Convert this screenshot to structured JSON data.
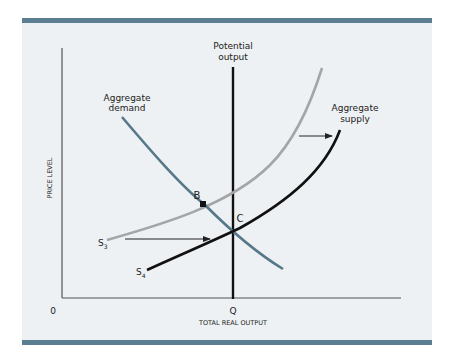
{
  "diagram": {
    "title": "",
    "y_axis_label": "PRICE LEVEL",
    "x_axis_label": "TOTAL REAL OUTPUT",
    "origin_label": "0",
    "q_label": "Q",
    "potential_output_label_line1": "Potential",
    "potential_output_label_line2": "output",
    "aggregate_demand_label_line1": "Aggregate",
    "aggregate_demand_label_line2": "demand",
    "aggregate_supply_label_line1": "Aggregate",
    "aggregate_supply_label_line2": "supply",
    "s3_label": "S",
    "s3_subscript": "3",
    "s4_label": "S",
    "s4_subscript": "4",
    "point_b_label": "B",
    "point_c_label": "C"
  },
  "colors": {
    "frame_bar": "#5b7f91",
    "panel_bg": "#eef1f3",
    "aggregate_demand": "#56788a",
    "supply_s3": "#a3a5a6",
    "supply_s4": "#111111",
    "axes": "#555555"
  }
}
